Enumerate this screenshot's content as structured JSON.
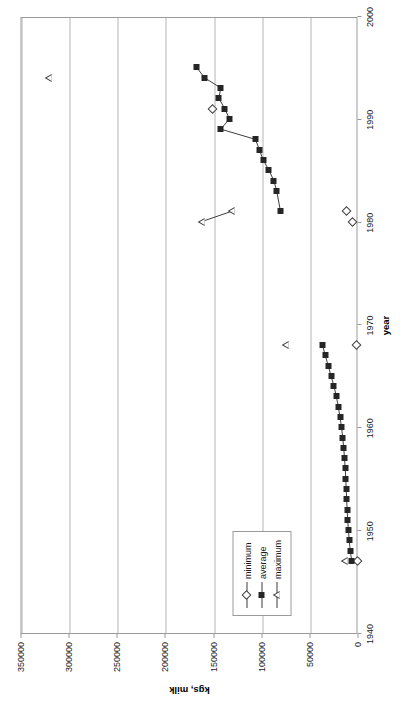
{
  "chart_data": {
    "type": "scatter",
    "title": "",
    "xlabel": "year",
    "ylabel": "kgs, milk",
    "xlim": [
      1940,
      2000
    ],
    "ylim": [
      0,
      350000
    ],
    "xticks": [
      1940,
      1950,
      1960,
      1970,
      1980,
      1990,
      2000
    ],
    "yticks": [
      0,
      50000,
      100000,
      150000,
      200000,
      250000,
      300000,
      350000
    ],
    "grid": "vertical-only-on-y-values",
    "legend_position": "lower-left",
    "series": [
      {
        "name": "minimum",
        "marker": "open-diamond",
        "connected": false,
        "points": [
          {
            "x": 1947,
            "y": 900
          },
          {
            "x": 1968,
            "y": 2500
          },
          {
            "x": 1980,
            "y": 6000
          },
          {
            "x": 1981,
            "y": 12500
          },
          {
            "x": 1991,
            "y": 152000
          }
        ]
      },
      {
        "name": "average",
        "marker": "filled-square",
        "connected": true,
        "points": [
          {
            "x": 1947,
            "y": 7000
          },
          {
            "x": 1948,
            "y": 8600
          },
          {
            "x": 1949,
            "y": 9600
          },
          {
            "x": 1950,
            "y": 10500
          },
          {
            "x": 1951,
            "y": 11200
          },
          {
            "x": 1952,
            "y": 11800
          },
          {
            "x": 1953,
            "y": 12300
          },
          {
            "x": 1954,
            "y": 12800
          },
          {
            "x": 1955,
            "y": 13200
          },
          {
            "x": 1956,
            "y": 13800
          },
          {
            "x": 1957,
            "y": 14500
          },
          {
            "x": 1958,
            "y": 15400
          },
          {
            "x": 1959,
            "y": 16400
          },
          {
            "x": 1960,
            "y": 17600
          },
          {
            "x": 1961,
            "y": 19200
          },
          {
            "x": 1962,
            "y": 21000
          },
          {
            "x": 1963,
            "y": 23000
          },
          {
            "x": 1964,
            "y": 25500
          },
          {
            "x": 1965,
            "y": 28500
          },
          {
            "x": 1966,
            "y": 31500
          },
          {
            "x": 1967,
            "y": 34500
          },
          {
            "x": 1968,
            "y": 37500
          },
          {
            "x": 1981,
            "y": 81000
          },
          {
            "x": 1983,
            "y": 85000
          },
          {
            "x": 1984,
            "y": 88000
          },
          {
            "x": 1985,
            "y": 93000
          },
          {
            "x": 1986,
            "y": 99000
          },
          {
            "x": 1987,
            "y": 103000
          },
          {
            "x": 1988,
            "y": 107000
          },
          {
            "x": 1989,
            "y": 143000
          },
          {
            "x": 1990,
            "y": 134000
          },
          {
            "x": 1991,
            "y": 139000
          },
          {
            "x": 1992,
            "y": 145000
          },
          {
            "x": 1993,
            "y": 143000
          },
          {
            "x": 1994,
            "y": 160000
          },
          {
            "x": 1995,
            "y": 168000
          }
        ]
      },
      {
        "name": "maximum",
        "marker": "open-triangle",
        "connected": true,
        "segments": [
          [
            {
              "x": 1980,
              "y": 163000
            },
            {
              "x": 1981,
              "y": 132000
            }
          ]
        ],
        "points": [
          {
            "x": 1947,
            "y": 15000
          },
          {
            "x": 1968,
            "y": 76000
          },
          {
            "x": 1980,
            "y": 163000
          },
          {
            "x": 1981,
            "y": 132000
          },
          {
            "x": 1994,
            "y": 322000
          }
        ]
      }
    ]
  },
  "legend": {
    "items": [
      {
        "label": "minimum",
        "marker": "open-diamond"
      },
      {
        "label": "average",
        "marker": "filled-square"
      },
      {
        "label": "maximum",
        "marker": "open-triangle"
      }
    ]
  },
  "axes": {
    "x_title": "year",
    "y_title": "kgs, milk",
    "x_tick_labels": [
      "1940",
      "1950",
      "1960",
      "1970",
      "1980",
      "1990",
      "2000"
    ],
    "y_tick_labels": [
      "0",
      "50000",
      "100000",
      "150000",
      "200000",
      "250000",
      "300000",
      "350000"
    ]
  },
  "colors": {
    "marker_fill": "#262626",
    "line": "#3d3d3d",
    "grid": "#b6b6b6",
    "axis": "#9a9a9a",
    "text": "#1a1a1a",
    "background": "#ffffff"
  }
}
